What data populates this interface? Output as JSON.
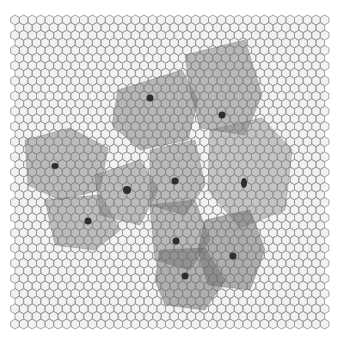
{
  "image": {
    "description": "Grayscale simulation of a hexagonal epithelial cell mesh with several enlarged translucent grey cells, each with a dark nucleus",
    "background_color": "#ffffff",
    "mesh_color": "#9a9a9a",
    "cell_fill": "#f2f2f2",
    "grid": {
      "x0": 15,
      "y0": 20,
      "x1": 326,
      "y1": 330,
      "cell_w": 8.6,
      "cell_h": 7.6
    },
    "large_cells": [
      {
        "points": "118,90 182,70 198,100 188,140 140,150 112,125",
        "shade": "#6e6e6e",
        "opacity": 0.45
      },
      {
        "points": "185,55 245,40 262,95 245,135 200,128 190,90",
        "shade": "#707070",
        "opacity": 0.45
      },
      {
        "points": "25,140 70,128 108,148 100,190 60,200 28,185",
        "shade": "#777777",
        "opacity": 0.45
      },
      {
        "points": "95,175 140,160 158,190 140,225 100,215",
        "shade": "#7a7a7a",
        "opacity": 0.45
      },
      {
        "points": "150,150 195,140 205,185 185,215 150,205",
        "shade": "#767676",
        "opacity": 0.45
      },
      {
        "points": "210,130 262,118 292,150 285,210 240,228 208,190",
        "shade": "#808080",
        "opacity": 0.4
      },
      {
        "points": "45,200 100,195 120,230 95,250 55,245",
        "shade": "#7a7a7a",
        "opacity": 0.45
      },
      {
        "points": "150,205 195,200 210,240 190,270 155,260",
        "shade": "#727272",
        "opacity": 0.45
      },
      {
        "points": "205,220 250,210 265,250 250,290 208,285 198,250",
        "shade": "#6a6a6a",
        "opacity": 0.5
      },
      {
        "points": "160,250 205,248 225,280 205,310 165,305 155,280",
        "shade": "#6c6c6c",
        "opacity": 0.5
      }
    ],
    "nuclei": [
      {
        "x": 150,
        "y": 98,
        "rx": 3.5,
        "ry": 3.5
      },
      {
        "x": 222,
        "y": 115,
        "rx": 3.5,
        "ry": 3.5
      },
      {
        "x": 55,
        "y": 166,
        "rx": 3.5,
        "ry": 3
      },
      {
        "x": 127,
        "y": 190,
        "rx": 4,
        "ry": 4
      },
      {
        "x": 175,
        "y": 181,
        "rx": 3.5,
        "ry": 3.5
      },
      {
        "x": 244,
        "y": 183,
        "rx": 3,
        "ry": 5
      },
      {
        "x": 88,
        "y": 221,
        "rx": 3.5,
        "ry": 3.5
      },
      {
        "x": 176,
        "y": 241,
        "rx": 3.5,
        "ry": 3.5
      },
      {
        "x": 233,
        "y": 256,
        "rx": 3.5,
        "ry": 3.5
      },
      {
        "x": 185,
        "y": 276,
        "rx": 3.5,
        "ry": 3.5
      }
    ],
    "nucleus_color": "#2e2e2e"
  }
}
